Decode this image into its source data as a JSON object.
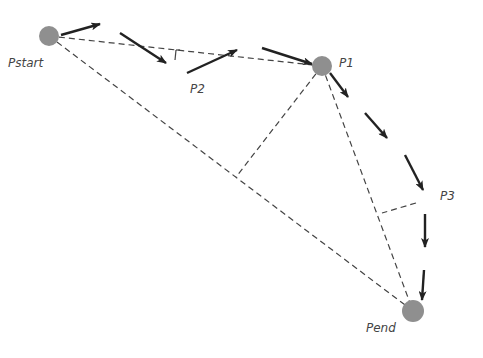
{
  "diagram": {
    "type": "trajectory-simplification",
    "points": [
      {
        "id": "pstart",
        "label": "Pstart",
        "x": 49,
        "y": 36,
        "r": 10,
        "label_x": 8,
        "label_y": 67
      },
      {
        "id": "p1",
        "label": "P1",
        "x": 322,
        "y": 66,
        "r": 10,
        "label_x": 339,
        "label_y": 67
      },
      {
        "id": "p2",
        "label": "P2",
        "x": null,
        "y": null,
        "label_x": 190,
        "label_y": 93
      },
      {
        "id": "p3",
        "label": "P3",
        "x": null,
        "y": null,
        "label_x": 440,
        "label_y": 200
      },
      {
        "id": "pend",
        "label": "Pend",
        "x": 413,
        "y": 311,
        "r": 11,
        "label_x": 366,
        "label_y": 332
      }
    ],
    "dashed_lines": [
      {
        "name": "pstart-to-p1",
        "x1": 49,
        "y1": 36,
        "x2": 322,
        "y2": 66
      },
      {
        "name": "pstart-to-pend",
        "x1": 49,
        "y1": 36,
        "x2": 413,
        "y2": 311
      },
      {
        "name": "p1-to-pend",
        "x1": 322,
        "y1": 66,
        "x2": 413,
        "y2": 311
      },
      {
        "name": "p1-perpendicular",
        "x1": 322,
        "y1": 66,
        "x2": 236,
        "y2": 177
      },
      {
        "name": "p3-perpendicular",
        "x1": 416,
        "y1": 203,
        "x2": 382,
        "y2": 213
      },
      {
        "name": "p2-perp-mark-a",
        "x1": 176,
        "y1": 50,
        "x2": 180,
        "y2": 50
      },
      {
        "name": "p2-perp-mark-b",
        "x1": 176,
        "y1": 50,
        "x2": 175,
        "y2": 60
      }
    ],
    "arrows": [
      {
        "name": "arrow-1",
        "x1": 61,
        "y1": 35,
        "x2": 100,
        "y2": 24
      },
      {
        "name": "arrow-2",
        "x1": 120,
        "y1": 33,
        "x2": 166,
        "y2": 63
      },
      {
        "name": "arrow-3",
        "x1": 187,
        "y1": 73,
        "x2": 237,
        "y2": 50
      },
      {
        "name": "arrow-4",
        "x1": 262,
        "y1": 48,
        "x2": 312,
        "y2": 64
      },
      {
        "name": "arrow-5",
        "x1": 330,
        "y1": 73,
        "x2": 348,
        "y2": 97
      },
      {
        "name": "arrow-6",
        "x1": 365,
        "y1": 113,
        "x2": 387,
        "y2": 138
      },
      {
        "name": "arrow-7",
        "x1": 405,
        "y1": 155,
        "x2": 423,
        "y2": 190
      },
      {
        "name": "arrow-8",
        "x1": 425,
        "y1": 214,
        "x2": 425,
        "y2": 247
      },
      {
        "name": "arrow-9",
        "x1": 424,
        "y1": 270,
        "x2": 422,
        "y2": 300
      }
    ],
    "colors": {
      "point_fill": "#8f8f8f",
      "dashed_line": "#444444",
      "arrow": "#222222",
      "label": "#444444",
      "background": "#ffffff"
    }
  }
}
